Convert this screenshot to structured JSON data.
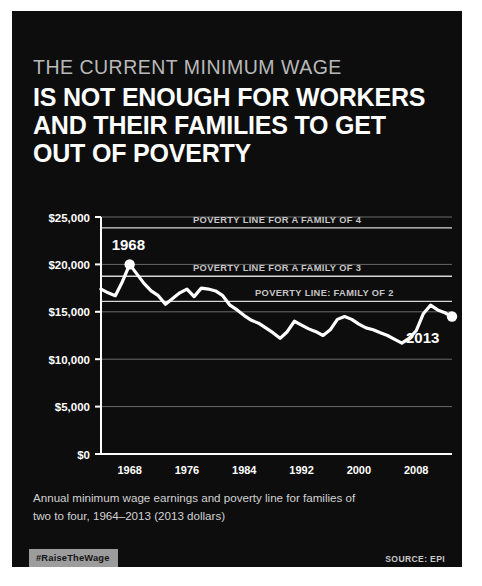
{
  "poster": {
    "background_color": "#0d0d0d",
    "eyebrow": "THE CURRENT MINIMUM WAGE",
    "title_line1": "IS NOT ENOUGH FOR WORKERS",
    "title_line2": "AND THEIR FAMILIES TO GET",
    "title_line3": "OUT OF POVERTY",
    "caption_line1": "Annual minimum wage earnings and poverty line for families of",
    "caption_line2": "two to four, 1964–2013 (2013 dollars)",
    "hashtag": "#RaiseTheWage",
    "source": "SOURCE: EPI",
    "hashtag_background": "#9c9c9c",
    "line_color": "#ffffff",
    "grid_color": "#6a6a6a"
  },
  "chart_data": {
    "type": "line",
    "title": "",
    "xlabel": "",
    "ylabel": "",
    "xlim": [
      1964,
      2013
    ],
    "ylim": [
      0,
      25000
    ],
    "grid": true,
    "legend_position": "inline-annotations",
    "y_ticks": [
      0,
      5000,
      10000,
      15000,
      20000,
      25000
    ],
    "y_tick_labels": [
      "$0",
      "$5,000",
      "$10,000",
      "$15,000",
      "$20,000",
      "$25,000"
    ],
    "x_ticks": [
      1968,
      1976,
      1984,
      1992,
      2000,
      2008
    ],
    "x_tick_labels": [
      "1968",
      "1976",
      "1984",
      "1992",
      "2000",
      "2008"
    ],
    "annotations": [
      {
        "label": "1968",
        "x": 1968,
        "y": 20000,
        "marker": true
      },
      {
        "label": "2013",
        "x": 2013,
        "y": 14500,
        "marker": true
      }
    ],
    "reference_lines": [
      {
        "label": "POVERTY LINE FOR A FAMILY OF 4",
        "value": 23850
      },
      {
        "label": "POVERTY LINE FOR A FAMILY OF 3",
        "value": 18750
      },
      {
        "label": "POVERTY LINE: FAMILY OF 2",
        "value": 16100
      }
    ],
    "series": [
      {
        "name": "Annual minimum wage earnings",
        "x": [
          1964,
          1965,
          1966,
          1967,
          1968,
          1969,
          1970,
          1971,
          1972,
          1973,
          1974,
          1975,
          1976,
          1977,
          1978,
          1979,
          1980,
          1981,
          1982,
          1983,
          1984,
          1985,
          1986,
          1987,
          1988,
          1989,
          1990,
          1991,
          1992,
          1993,
          1994,
          1995,
          1996,
          1997,
          1998,
          1999,
          2000,
          2001,
          2002,
          2003,
          2004,
          2005,
          2006,
          2007,
          2008,
          2009,
          2010,
          2011,
          2012,
          2013
        ],
        "values": [
          17400,
          17000,
          16700,
          18200,
          20000,
          19000,
          18000,
          17200,
          16700,
          15800,
          16400,
          17000,
          17400,
          16600,
          17500,
          17400,
          17200,
          16700,
          15700,
          15200,
          14600,
          14100,
          13800,
          13300,
          12800,
          12200,
          12900,
          14000,
          13600,
          13200,
          12900,
          12500,
          13100,
          14200,
          14500,
          14200,
          13700,
          13300,
          13100,
          12800,
          12500,
          12100,
          11700,
          12200,
          13000,
          14800,
          15700,
          15200,
          14900,
          14500
        ]
      }
    ]
  }
}
